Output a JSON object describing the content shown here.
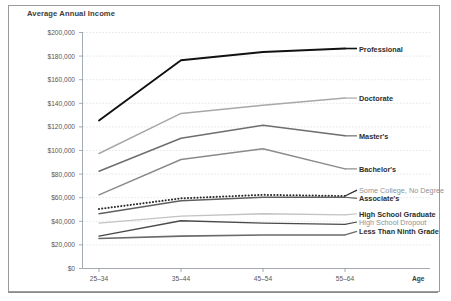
{
  "chart_title": "Average Annual Income",
  "axis": {
    "x_axis_label": "Age",
    "y_ticks": [
      "$0",
      "$20,000",
      "$40,000",
      "$60,000",
      "$80,000",
      "$100,000",
      "$120,000",
      "$140,000",
      "$160,000",
      "$180,000",
      "$200,000"
    ],
    "x_ticks": [
      "25–34",
      "35–44",
      "45–54",
      "55–64"
    ]
  },
  "caption": "",
  "chart_data": {
    "type": "line",
    "title": "Average Annual Income",
    "xlabel": "Age",
    "ylabel": "Average Annual Income",
    "categories": [
      "25–34",
      "35–44",
      "45–54",
      "55–64"
    ],
    "ylim": [
      0,
      200000
    ],
    "ytick_step": 20000,
    "grid": true,
    "legend": "inline-right-labels",
    "series": [
      {
        "name": "Professional",
        "values": [
          125000,
          176000,
          183000,
          186000
        ],
        "color": "#111111",
        "width": 1.9,
        "style": "solid",
        "label_y": 186000
      },
      {
        "name": "Doctorate",
        "values": [
          97000,
          131000,
          138000,
          144000
        ],
        "color": "#a8a8a8",
        "width": 1.5,
        "style": "solid",
        "label_y": 144000
      },
      {
        "name": "Master's",
        "values": [
          82000,
          110000,
          121000,
          112000
        ],
        "color": "#6e6e6e",
        "width": 1.5,
        "style": "solid",
        "label_y": 112000
      },
      {
        "name": "Bachelor's",
        "values": [
          62000,
          92000,
          101000,
          84000
        ],
        "color": "#8a8a8a",
        "width": 1.5,
        "style": "solid",
        "label_y": 84000
      },
      {
        "name": "Some College, No Degree",
        "values": [
          50000,
          59000,
          62000,
          61000
        ],
        "color": "#2a2a2a",
        "width": 1.5,
        "style": "dotted",
        "label_y": 66000
      },
      {
        "name": "Associate's",
        "values": [
          46000,
          57000,
          60000,
          60000
        ],
        "color": "#5f5f5f",
        "width": 1.4,
        "style": "solid",
        "label_y": 59000
      },
      {
        "name": "High School Graduate",
        "values": [
          38000,
          44000,
          46000,
          45000
        ],
        "color": "#c3c3c3",
        "width": 1.4,
        "style": "solid",
        "label_y": 46000
      },
      {
        "name": "High School Dropout",
        "values": [
          27000,
          40000,
          38000,
          37000
        ],
        "color": "#4a4a4a",
        "width": 1.4,
        "style": "solid",
        "label_y": 39000
      },
      {
        "name": "Less Than Ninth Grade",
        "values": [
          25000,
          27000,
          28000,
          28000
        ],
        "color": "#6a6a6a",
        "width": 1.6,
        "style": "solid",
        "label_y": 31000
      }
    ],
    "series_label_styles": [
      "strong",
      "strong",
      "strong",
      "strong",
      "light",
      "strong",
      "strong",
      "light",
      "strong"
    ]
  }
}
